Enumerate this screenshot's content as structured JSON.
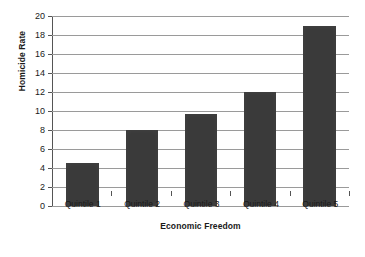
{
  "chart_data": {
    "type": "bar",
    "title": "",
    "xlabel": "Economic Freedom",
    "ylabel": "Homicide Rate",
    "categories": [
      "Quintile 1",
      "Quintile 2",
      "Quintile 3",
      "Quintile 4",
      "Quintile 5"
    ],
    "values": [
      4.5,
      8.0,
      9.7,
      12.0,
      19.0
    ],
    "ylim": [
      0,
      20
    ],
    "ytick_step": 2,
    "ytick_labels": [
      "20",
      "18",
      "16",
      "14",
      "12",
      "10",
      "8",
      "6",
      "4",
      "2",
      "0"
    ],
    "grid": true,
    "grid_axis": "y",
    "legend": false,
    "bar_color": "#3a3a3a",
    "grid_color": "#9a9a9a",
    "axis_color": "#555555",
    "background": "#ffffff"
  }
}
